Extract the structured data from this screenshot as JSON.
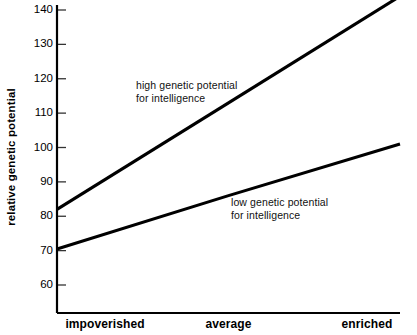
{
  "chart_data": {
    "type": "line",
    "title": "",
    "subtitle": "",
    "xlabel": "",
    "ylabel": "relative genetic potential",
    "categories": [
      "impoverished",
      "average",
      "enriched"
    ],
    "x": [
      0,
      1,
      2
    ],
    "ylim": [
      55,
      145
    ],
    "xlim": [
      -0.12,
      2.0
    ],
    "yticks": [
      60,
      70,
      80,
      90,
      100,
      110,
      120,
      130,
      140
    ],
    "ytick_labels": [
      "60",
      "70",
      "80",
      "90",
      "100",
      "110",
      "120",
      "130",
      "140"
    ],
    "grid": false,
    "legend": "none",
    "series": [
      {
        "name": "high genetic potential for intelligence",
        "annotation": [
          "high genetic potential",
          "for intelligence"
        ],
        "values": [
          82,
          113,
          144
        ],
        "color": "#000000",
        "line_width": 3.1
      },
      {
        "name": "low genetic potential for intelligence",
        "annotation": [
          "low genetic potential",
          "for intelligence"
        ],
        "values": [
          70.5,
          86,
          101
        ],
        "color": "#000000",
        "line_width": 3.1
      }
    ]
  },
  "top_caption": "",
  "axes": {
    "axis_color": "#000000",
    "tick_color": "#333333",
    "background": "#ffffff"
  }
}
